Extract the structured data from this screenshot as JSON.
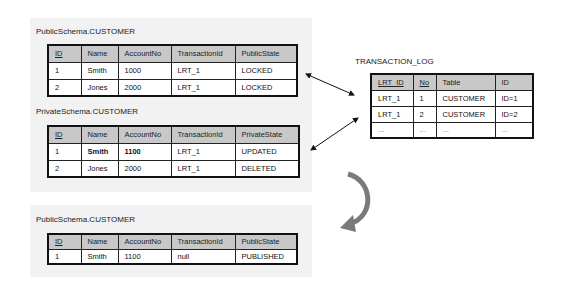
{
  "tables": {
    "public_before": {
      "title": "PublicSchema.CUSTOMER",
      "headers": [
        "ID",
        "Name",
        "AccountNo",
        "TransactionId",
        "PublicState"
      ],
      "rows": [
        [
          "1",
          "Smith",
          "1000",
          "LRT_1",
          "LOCKED"
        ],
        [
          "2",
          "Jones",
          "2000",
          "LRT_1",
          "LOCKED"
        ]
      ]
    },
    "private": {
      "title": "PrivateSchema.CUSTOMER",
      "headers": [
        "ID",
        "Name",
        "AccountNo",
        "TransactionId",
        "PrivateState"
      ],
      "rows": [
        [
          "1",
          "Smith",
          "1100",
          "LRT_1",
          "UPDATED"
        ],
        [
          "2",
          "Jones",
          "2000",
          "LRT_1",
          "DELETED"
        ]
      ]
    },
    "public_after": {
      "title": "PublicSchema.CUSTOMER",
      "headers": [
        "ID",
        "Name",
        "AccountNo",
        "TransactionId",
        "PublicState"
      ],
      "rows": [
        [
          "1",
          "Smith",
          "1100",
          "null",
          "PUBLISHED"
        ]
      ]
    },
    "transaction_log": {
      "title": "TRANSACTION_LOG",
      "headers": [
        "LRT_ID",
        "No",
        "Table",
        "ID"
      ],
      "rows": [
        [
          "LRT_1",
          "1",
          "CUSTOMER",
          "ID=1"
        ],
        [
          "LRT_1",
          "2",
          "CUSTOMER",
          "ID=2"
        ],
        [
          "...",
          "...",
          "...",
          "..."
        ]
      ]
    }
  },
  "icons": {
    "link_arrow_1": "double-headed-arrow",
    "link_arrow_2": "double-headed-arrow",
    "flow_arrow": "curved-arrow-down-left"
  },
  "colors": {
    "header_bg": "#c8c8c8",
    "panel_bg": "#f2f2f2",
    "curved_arrow": "#7a7a7a"
  }
}
